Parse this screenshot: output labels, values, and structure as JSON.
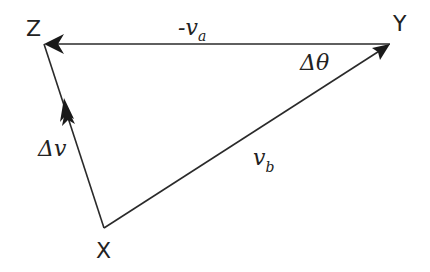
{
  "diagram": {
    "vertices": {
      "Z": {
        "label": "Z"
      },
      "Y": {
        "label": "Y"
      },
      "X": {
        "label": "X"
      }
    },
    "edges": {
      "YZ": {
        "label_sign": "-",
        "label_main": "v",
        "label_sub": "a",
        "from": "Y",
        "to": "Z"
      },
      "XY": {
        "label_main": "v",
        "label_sub": "b",
        "from": "X",
        "to": "Y"
      },
      "XZ": {
        "label_main": "Δv",
        "from": "X",
        "to": "Z"
      }
    },
    "angle": {
      "label": "Δθ",
      "at": "Y"
    }
  }
}
